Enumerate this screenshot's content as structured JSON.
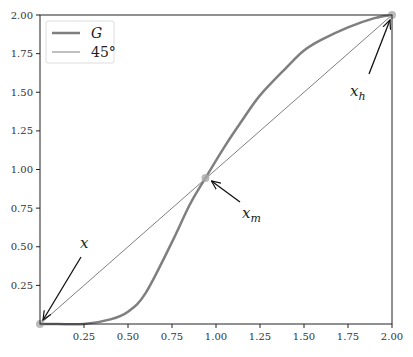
{
  "chart_data": {
    "type": "line",
    "title": "",
    "xlabel": "",
    "ylabel": "",
    "xlim": [
      0,
      2
    ],
    "ylim": [
      0,
      2
    ],
    "grid": false,
    "legend_position": "upper left",
    "x_ticks": [
      "0.25",
      "0.50",
      "0.75",
      "1.00",
      "1.25",
      "1.50",
      "1.75",
      "2.00"
    ],
    "y_ticks": [
      "0.25",
      "0.50",
      "0.75",
      "1.00",
      "1.25",
      "1.50",
      "1.75",
      "2.00"
    ],
    "series": [
      {
        "name": "G",
        "color": "#7f7f7f",
        "linewidth": 2.5,
        "x": [
          0,
          0.1,
          0.25,
          0.4,
          0.5,
          0.6,
          0.75,
          0.85,
          0.94,
          1.05,
          1.15,
          1.25,
          1.4,
          1.5,
          1.6,
          1.75,
          1.9,
          2.0
        ],
        "y": [
          0,
          0.0,
          0.0,
          0.03,
          0.08,
          0.2,
          0.53,
          0.77,
          0.945,
          1.15,
          1.32,
          1.48,
          1.66,
          1.77,
          1.84,
          1.92,
          1.98,
          2.0
        ]
      },
      {
        "name": "45°",
        "color": "#7f7f7f",
        "linewidth": 1,
        "x": [
          0,
          2
        ],
        "y": [
          0,
          2
        ]
      }
    ],
    "annotations": [
      {
        "label": "x",
        "point": [
          0.0,
          0.0
        ],
        "text_pos": [
          0.23,
          0.52
        ]
      },
      {
        "label": "x_m",
        "point": [
          0.94,
          0.945
        ],
        "text_pos": [
          1.15,
          0.7
        ]
      },
      {
        "label": "x_h",
        "point": [
          2.0,
          2.0
        ],
        "text_pos": [
          1.8,
          1.5
        ]
      }
    ]
  },
  "legend": {
    "items": [
      {
        "label": "G"
      },
      {
        "label": "45°"
      }
    ]
  },
  "annotations": {
    "x": "x",
    "xm_base": "x",
    "xm_sub": "m",
    "xh_base": "x",
    "xh_sub": "h"
  }
}
